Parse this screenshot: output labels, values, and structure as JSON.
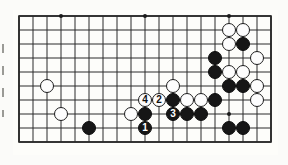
{
  "figure": {
    "type": "go-board-diagram",
    "title": "",
    "board": {
      "columns": 19,
      "rows": 10,
      "origin_x": 6,
      "origin_y": 6,
      "line_color": "#2b2b2b",
      "background_color": "#fdfdfa",
      "cell_size": 14,
      "star_points": [
        {
          "col": 3,
          "row": 0
        },
        {
          "col": 9,
          "row": 0
        },
        {
          "col": 15,
          "row": 0
        },
        {
          "col": 15,
          "row": 7
        }
      ]
    },
    "stone_colors": {
      "black": "#161616",
      "white": "#fdfdfd",
      "black_outline": "#0d0d0d",
      "white_outline": "#1d1d1d",
      "black_label": "#ffffff",
      "white_label": "#111111"
    },
    "stones": [
      {
        "id": "w-c2-r5",
        "color": "white",
        "col": 2,
        "row": 5,
        "label": ""
      },
      {
        "id": "w-c3-r7",
        "color": "white",
        "col": 3,
        "row": 7,
        "label": ""
      },
      {
        "id": "b-c5-r8",
        "color": "black",
        "col": 5,
        "row": 8,
        "label": ""
      },
      {
        "id": "w-c8-r7",
        "color": "white",
        "col": 8,
        "row": 7,
        "label": ""
      },
      {
        "id": "b-c9-r7",
        "color": "black",
        "col": 9,
        "row": 7,
        "label": ""
      },
      {
        "id": "w-c9-r6",
        "color": "white",
        "col": 9,
        "row": 6,
        "label": "4"
      },
      {
        "id": "w-c10-r6",
        "color": "white",
        "col": 10,
        "row": 6,
        "label": "2"
      },
      {
        "id": "b-c9-r8",
        "color": "black",
        "col": 9,
        "row": 8,
        "label": "1"
      },
      {
        "id": "b-c11-r7",
        "color": "black",
        "col": 11,
        "row": 7,
        "label": "3"
      },
      {
        "id": "w-c11-r5",
        "color": "white",
        "col": 11,
        "row": 5,
        "label": ""
      },
      {
        "id": "b-c11-r6",
        "color": "black",
        "col": 11,
        "row": 6,
        "label": ""
      },
      {
        "id": "w-c12-r6",
        "color": "white",
        "col": 12,
        "row": 6,
        "label": ""
      },
      {
        "id": "w-c13-r6",
        "color": "white",
        "col": 13,
        "row": 6,
        "label": ""
      },
      {
        "id": "b-c12-r7",
        "color": "black",
        "col": 12,
        "row": 7,
        "label": ""
      },
      {
        "id": "b-c13-r7",
        "color": "black",
        "col": 13,
        "row": 7,
        "label": ""
      },
      {
        "id": "b-c14-r3",
        "color": "black",
        "col": 14,
        "row": 3,
        "label": ""
      },
      {
        "id": "b-c14-r4",
        "color": "black",
        "col": 14,
        "row": 4,
        "label": ""
      },
      {
        "id": "w-c15-r1",
        "color": "white",
        "col": 15,
        "row": 1,
        "label": ""
      },
      {
        "id": "w-c16-r1",
        "color": "white",
        "col": 16,
        "row": 1,
        "label": ""
      },
      {
        "id": "w-c15-r2",
        "color": "white",
        "col": 15,
        "row": 2,
        "label": ""
      },
      {
        "id": "b-c16-r2",
        "color": "black",
        "col": 16,
        "row": 2,
        "label": ""
      },
      {
        "id": "w-c17-r3",
        "color": "white",
        "col": 17,
        "row": 3,
        "label": ""
      },
      {
        "id": "w-c15-r4",
        "color": "white",
        "col": 15,
        "row": 4,
        "label": ""
      },
      {
        "id": "w-c16-r4",
        "color": "white",
        "col": 16,
        "row": 4,
        "label": ""
      },
      {
        "id": "b-c15-r5",
        "color": "black",
        "col": 15,
        "row": 5,
        "label": ""
      },
      {
        "id": "b-c16-r5",
        "color": "black",
        "col": 16,
        "row": 5,
        "label": ""
      },
      {
        "id": "w-c17-r5",
        "color": "white",
        "col": 17,
        "row": 5,
        "label": ""
      },
      {
        "id": "b-c14-r6",
        "color": "black",
        "col": 14,
        "row": 6,
        "label": ""
      },
      {
        "id": "w-c17-r6",
        "color": "white",
        "col": 17,
        "row": 6,
        "label": ""
      },
      {
        "id": "b-c15-r8",
        "color": "black",
        "col": 15,
        "row": 8,
        "label": ""
      },
      {
        "id": "b-c16-r8",
        "color": "black",
        "col": 16,
        "row": 8,
        "label": ""
      }
    ],
    "move_sequence": [
      {
        "number": "1",
        "color": "black"
      },
      {
        "number": "2",
        "color": "white"
      },
      {
        "number": "3",
        "color": "black"
      },
      {
        "number": "4",
        "color": "white"
      }
    ]
  }
}
